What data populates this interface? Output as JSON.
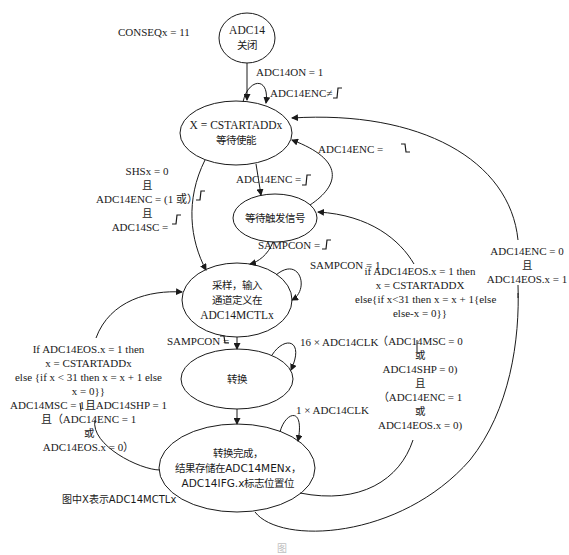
{
  "diagram": {
    "type": "state-machine",
    "note": "图中X表示ADC14MCTLx",
    "top_condition": "CONSEQx = 11",
    "states": [
      {
        "id": "off",
        "lines": [
          "ADC14",
          "关闭"
        ]
      },
      {
        "id": "wait_enable",
        "lines": [
          "X = CSTARTADDx",
          "等待使能"
        ]
      },
      {
        "id": "wait_trigger",
        "lines": [
          "等待触发信号"
        ]
      },
      {
        "id": "sample",
        "lines": [
          "采样，输入",
          "通道定义在",
          "ADC14MCTLx"
        ]
      },
      {
        "id": "convert",
        "lines": [
          "转换"
        ]
      },
      {
        "id": "done",
        "lines": [
          "转换完成，",
          "结果存储在ADC14MENx，",
          "ADC14IFG.x标志位置位"
        ]
      }
    ],
    "transitions": {
      "off_to_wait": "ADC14ON = 1",
      "wait_self": "ADC14ENC≠",
      "trigger_to_wait": "ADC14ENC =",
      "wait_to_trigger": "ADC14ENC =",
      "wait_to_sample": [
        "SHSx = 0",
        "且",
        "ADC14ENC = (1 或",
        "且",
        "ADC14SC ="
      ],
      "trigger_to_sample": "SAMPCON =",
      "sample_self_to_trigger": "SAMPCON = 1",
      "sample_to_convert": "SAMPCON =",
      "convert_self": "16 × ADC14CLK",
      "done_self": "1 × ADC14CLK",
      "done_to_sample_left": [
        "If ADC14EOS.x = 1 then",
        "x = CSTARTADDx",
        "else {if x < 31 then x = x + 1 else",
        "x = 0}}",
        "ADC14MSC = 1且ADC14SHP = 1",
        "且（ADC14ENC = 1",
        "或",
        "ADC14EOS.x = 0）"
      ],
      "done_to_trigger_right": [
        "if ADC14EOS.x = 1 then",
        "x = CSTARTADDX",
        "else{if x<31 then x = x + 1{else",
        "else-x = 0}}",
        "（ADC14MSC = 0",
        "或",
        "ADC14SHP = 0)",
        "且",
        "（ADC14ENC = 1",
        "或",
        "ADC14EOS.x = 0)"
      ],
      "done_to_wait_far": [
        "ADC14ENC = 0",
        "且",
        "ADC14EOS.x = 1"
      ]
    },
    "caption": "图"
  }
}
